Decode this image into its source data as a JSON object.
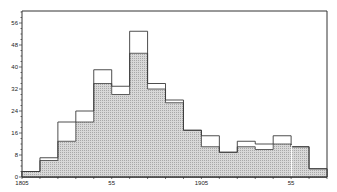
{
  "chart_data": {
    "type": "bar",
    "subtype": "overlaid-step-histogram",
    "title": "",
    "xlabel": "",
    "ylabel": "",
    "bin_width_years": 10,
    "x_start": 1805,
    "x_end": 1975,
    "categories": [
      "1805-15",
      "1815-25",
      "1825-35",
      "1835-45",
      "1845-55",
      "1855-65",
      "1865-75",
      "1875-85",
      "1885-95",
      "1895-1905",
      "1905-15",
      "1915-25",
      "1925-35",
      "1935-45",
      "1945-55",
      "1955-65",
      "1965-75"
    ],
    "series": [
      {
        "name": "total (outline)",
        "style": "outline",
        "values": [
          2,
          7,
          20,
          24,
          39,
          33,
          53,
          34,
          28,
          17,
          15,
          9,
          13,
          12,
          15,
          11,
          3
        ]
      },
      {
        "name": "subset (shaded)",
        "style": "hatched",
        "values": [
          2,
          6,
          13,
          20,
          34,
          30,
          45,
          32,
          27,
          17,
          11,
          9,
          11,
          10,
          12,
          11,
          3
        ]
      }
    ],
    "ylim": [
      0,
      60
    ],
    "yticks": [
      0,
      8,
      16,
      24,
      32,
      40,
      48,
      56
    ],
    "xticks": [
      {
        "value": 1805,
        "label": "1805"
      },
      {
        "value": 1855,
        "label": "55"
      },
      {
        "value": 1905,
        "label": "1905"
      },
      {
        "value": 1955,
        "label": "55"
      }
    ],
    "grid": false,
    "legend": "none"
  },
  "colors": {
    "outline": "#3a3a3a",
    "shade": "#d4d4d4",
    "shade_dot": "#a8a8a8",
    "axis": "#333333"
  }
}
